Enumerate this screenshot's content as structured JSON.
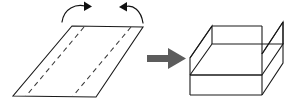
{
  "figure": {
    "background_color": "#ffffff",
    "line_color": "#1a1a1a",
    "dash_color": "#3a3a3a",
    "arrow_color": "#5c5c5c",
    "rotation_arrow_color": "#111111"
  },
  "left_panel": {
    "name": "flat-sheet",
    "shape": "parallelogram",
    "label": "",
    "outline_points": "72,26 143,27 96,97 13,96",
    "fold_lines": [
      {
        "name": "fold-line-left",
        "points": "84,27 26,96"
      },
      {
        "name": "fold-line-right",
        "points": "131,27 73,96"
      }
    ],
    "rotation_arrows": [
      {
        "name": "fold-up-arrow-left",
        "direction": "clockwise-right",
        "arc_path": "M 62,22 C 64,8 76,4 85,6",
        "head_points": "84,1.5 92,6.5 84,11"
      },
      {
        "name": "fold-up-arrow-right",
        "direction": "counterclockwise-left",
        "arc_path": "M 143,23 C 141,10 133,5 126,6.5",
        "head_points": "127,2 119,7 127,11.5"
      }
    ]
  },
  "transform_arrow": {
    "name": "transform-arrow",
    "label": "",
    "shaft": "147,55 170,55 170,62 147,62",
    "head": "168,48 186,58.5 168,69"
  },
  "right_panel": {
    "name": "folded-channel",
    "shape": "u-channel",
    "label": "",
    "base_top": "210,75 283,22 262,22 190,75",
    "base_outer": "190,75 262,75 283,22",
    "near_end": "190,75 190,95 262,95 262,75",
    "left_wall": "190,75 190,95 212,44 212,26",
    "right_wall": "262,75 262,95 283,44 283,22",
    "inner_floor": "196,82 214,49 285,49 267,82"
  },
  "legend": {
    "dashed_line_meaning": "fold line",
    "curved_arrow_meaning": "fold direction",
    "block_arrow_meaning": "results in"
  }
}
